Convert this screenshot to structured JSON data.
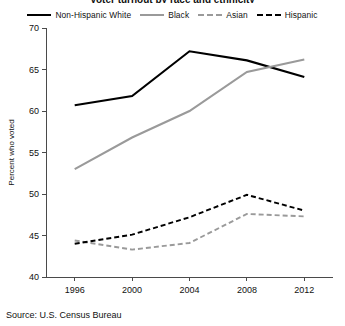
{
  "chart_data": {
    "type": "line",
    "title": "Voter turnout by race and ethnicity",
    "xlabel": "",
    "ylabel": "Percent who voted",
    "categories": [
      "1996",
      "2000",
      "2004",
      "2008",
      "2012"
    ],
    "x": [
      1996,
      2000,
      2004,
      2008,
      2012
    ],
    "xlim": [
      1994,
      2014
    ],
    "ylim": [
      40,
      70
    ],
    "yticks": [
      40,
      45,
      50,
      55,
      60,
      65,
      70
    ],
    "xticks": [
      1996,
      2000,
      2004,
      2008,
      2012
    ],
    "grid": false,
    "legend_position": "top",
    "series": [
      {
        "name": "Non-Hispanic White",
        "color": "#000000",
        "style": "solid",
        "values": [
          60.7,
          61.8,
          67.2,
          66.1,
          64.1
        ]
      },
      {
        "name": "Black",
        "color": "#9a9a9a",
        "style": "solid",
        "values": [
          53.0,
          56.8,
          60.0,
          64.7,
          66.2
        ]
      },
      {
        "name": "Asian",
        "color": "#9a9a9a",
        "style": "dashed",
        "values": [
          44.4,
          43.3,
          44.1,
          47.6,
          47.3
        ]
      },
      {
        "name": "Hispanic",
        "color": "#000000",
        "style": "dashed",
        "values": [
          44.0,
          45.1,
          47.2,
          49.9,
          48.0
        ]
      }
    ],
    "source": "Source: U.S. Census Bureau"
  }
}
